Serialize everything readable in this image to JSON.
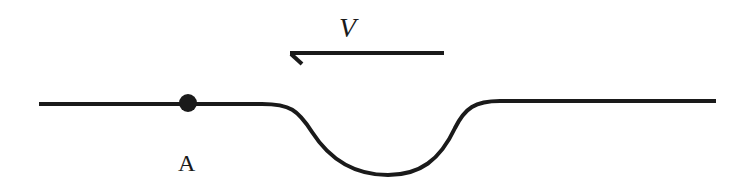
{
  "diagram": {
    "type": "physics-track-diagram",
    "stroke_color": "#1a1a1a",
    "background": "#ffffff",
    "velocity_label": "V",
    "velocity_direction": "left",
    "point_label": "A",
    "elements": {
      "track": "horizontal line with a semicircular dip (valley) to the right of point A",
      "point": "solid dot on track at A",
      "arrow": "leftward velocity arrow above the dip"
    }
  }
}
